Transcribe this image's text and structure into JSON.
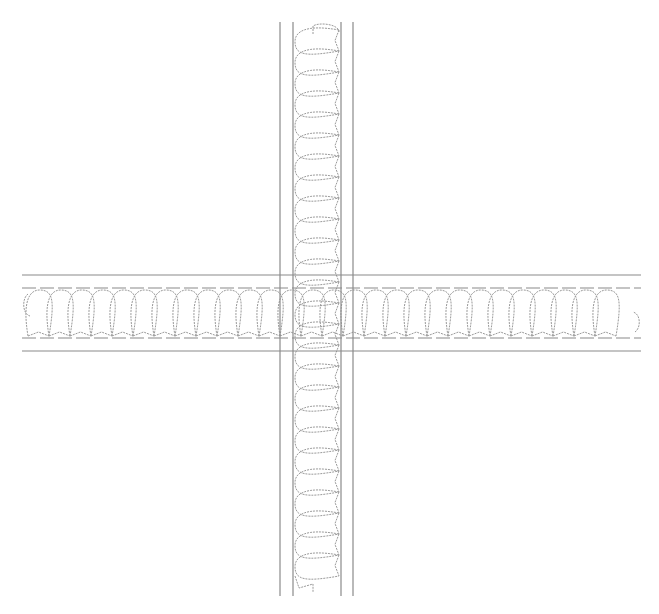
{
  "drawing": {
    "type": "wall-intersection-detail",
    "description": "Cross (plus) intersection of two insulated walls, plan view",
    "stroke_color": "#8a8a8a",
    "insulation_color": "#9a9a9a",
    "background": "#ffffff"
  },
  "vertical_wall": {
    "outer_left_x": 280,
    "inner_left_x": 293,
    "inner_right_x": 341,
    "outer_right_x": 353,
    "top_y": 22,
    "bottom_y": 596,
    "insulation_pitch": 21
  },
  "horizontal_wall": {
    "outer_top_y": 275,
    "inner_top_y": 288,
    "inner_bottom_y": 338,
    "outer_bottom_y": 351,
    "left_x": 22,
    "right_x": 641,
    "insulation_pitch": 21
  }
}
